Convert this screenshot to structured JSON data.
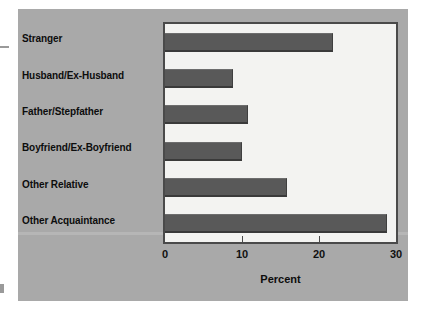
{
  "chart_data": {
    "type": "bar",
    "orientation": "horizontal",
    "title": "",
    "xlabel": "Percent",
    "ylabel": "",
    "categories": [
      "Stranger",
      "Husband/Ex-Husband",
      "Father/Stepfather",
      "Boyfriend/Ex-Boyfriend",
      "Other Relative",
      "Other Acquaintance"
    ],
    "values": [
      21.8,
      8.8,
      10.8,
      10.0,
      15.9,
      28.8
    ],
    "xlim": [
      0,
      30
    ],
    "xticks": [
      0,
      10,
      20,
      30
    ],
    "xtick_labels": [
      "0",
      "10",
      "20",
      "30"
    ],
    "grid": false,
    "legend": false,
    "bar_color": "#595959",
    "plot_background": "#f3f3f1",
    "figure_background": "#a9a9a9",
    "axis_color": "#4a4a4a"
  }
}
